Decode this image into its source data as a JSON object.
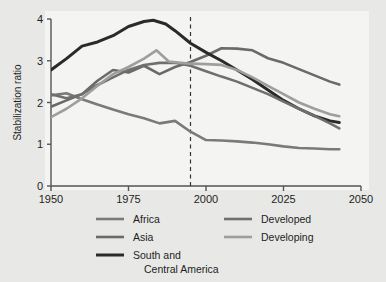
{
  "figure": {
    "background_color": "#e8e8e6",
    "plot_background_color": "#f4f4f2",
    "axis_color": "#555555"
  },
  "chart_data": {
    "type": "line",
    "title": "",
    "xlabel": "",
    "ylabel": "Stabilization ratio",
    "xlim": [
      1950,
      2050
    ],
    "ylim": [
      0,
      4
    ],
    "xticks": [
      1950,
      1975,
      2000,
      2025,
      2050
    ],
    "xtick_labels": [
      "1950",
      "1975",
      "2000",
      "2025",
      "2050"
    ],
    "yticks": [
      0,
      1,
      2,
      3,
      4
    ],
    "ytick_labels": [
      "0",
      "1",
      "2",
      "3",
      "4"
    ],
    "grid": false,
    "legend_position": "below",
    "annotations": [
      {
        "name": "present-day-marker",
        "type": "vline",
        "x": 1995,
        "style": "dashed",
        "color": "#333333",
        "label": ""
      }
    ],
    "series": [
      {
        "name": "Africa",
        "color": "#7a7a7a",
        "width": 2.6,
        "x": [
          1950,
          1955,
          1960,
          1965,
          1970,
          1975,
          1980,
          1985,
          1990,
          1995,
          2000,
          2005,
          2010,
          2015,
          2020,
          2025,
          2030,
          2035,
          2040,
          2043
        ],
        "y": [
          2.17,
          2.22,
          2.08,
          1.95,
          1.83,
          1.72,
          1.62,
          1.5,
          1.56,
          1.3,
          1.1,
          1.09,
          1.07,
          1.04,
          1.0,
          0.95,
          0.91,
          0.9,
          0.88,
          0.88
        ]
      },
      {
        "name": "Asia",
        "color": "#6a6a6a",
        "width": 2.6,
        "x": [
          1950,
          1955,
          1960,
          1965,
          1970,
          1975,
          1980,
          1985,
          1990,
          1995,
          2000,
          2005,
          2010,
          2015,
          2020,
          2025,
          2030,
          2035,
          2040,
          2043
        ],
        "y": [
          1.9,
          2.05,
          2.2,
          2.52,
          2.78,
          2.72,
          2.88,
          2.68,
          2.85,
          2.97,
          3.12,
          3.3,
          3.29,
          3.25,
          3.06,
          2.95,
          2.8,
          2.65,
          2.5,
          2.43
        ]
      },
      {
        "name": "South and Central America",
        "color": "#2a2a2a",
        "width": 3.0,
        "x": [
          1950,
          1955,
          1960,
          1965,
          1970,
          1975,
          1980,
          1983,
          1987,
          1990,
          1995,
          2000,
          2005,
          2010,
          2015,
          2020,
          2025,
          2030,
          2035,
          2040,
          2043
        ],
        "y": [
          2.78,
          3.05,
          3.35,
          3.45,
          3.6,
          3.82,
          3.94,
          3.97,
          3.88,
          3.72,
          3.42,
          3.2,
          3.0,
          2.78,
          2.55,
          2.3,
          2.05,
          1.85,
          1.68,
          1.56,
          1.52
        ]
      },
      {
        "name": "Developed",
        "color": "#6f6f6f",
        "width": 2.6,
        "x": [
          1950,
          1955,
          1960,
          1965,
          1970,
          1975,
          1980,
          1985,
          1990,
          1995,
          2000,
          2005,
          2010,
          2015,
          2020,
          2025,
          2030,
          2035,
          2040,
          2043
        ],
        "y": [
          2.2,
          2.1,
          2.2,
          2.42,
          2.6,
          2.78,
          2.9,
          2.95,
          2.95,
          2.88,
          2.75,
          2.62,
          2.5,
          2.35,
          2.2,
          2.02,
          1.85,
          1.68,
          1.5,
          1.38
        ]
      },
      {
        "name": "Developing",
        "color": "#9e9e9e",
        "width": 2.6,
        "x": [
          1950,
          1955,
          1960,
          1965,
          1970,
          1975,
          1980,
          1984,
          1988,
          1992,
          1995,
          2000,
          2005,
          2010,
          2015,
          2020,
          2025,
          2030,
          2035,
          2040,
          2043
        ],
        "y": [
          1.65,
          1.85,
          2.1,
          2.4,
          2.68,
          2.85,
          3.05,
          3.25,
          2.98,
          2.95,
          2.93,
          2.92,
          2.9,
          2.78,
          2.6,
          2.4,
          2.2,
          2.0,
          1.85,
          1.72,
          1.67
        ]
      }
    ],
    "legend": [
      {
        "label": "Africa",
        "color": "#7a7a7a"
      },
      {
        "label": "Developed",
        "color": "#6f6f6f"
      },
      {
        "label": "Asia",
        "color": "#6a6a6a"
      },
      {
        "label": "Developing",
        "color": "#9e9e9e"
      },
      {
        "label": "South and",
        "label2": "Central America",
        "color": "#2a2a2a"
      }
    ]
  }
}
